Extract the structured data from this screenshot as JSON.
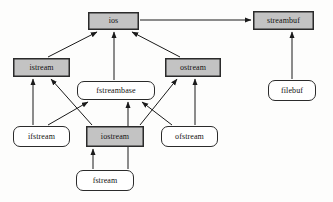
{
  "diagram": {
    "type": "class-inheritance-diagram",
    "canvas": {
      "width": 333,
      "height": 202
    },
    "colors": {
      "background": "#fdfdfc",
      "shaded_fill": "#c3c3c3",
      "plain_fill": "#ffffff",
      "stroke": "#2b2b2b",
      "text": "#111111"
    },
    "legend": {
      "shaded_meaning": "shaded box",
      "plain_meaning": "rounded white box"
    },
    "nodes": [
      {
        "id": "ios",
        "label": "ios",
        "style": "shaded",
        "x": 88,
        "y": 12,
        "w": 51,
        "h": 18
      },
      {
        "id": "streambuf",
        "label": "streambuf",
        "style": "shaded",
        "x": 253,
        "y": 11,
        "w": 61,
        "h": 19
      },
      {
        "id": "istream",
        "label": "istream",
        "style": "shaded",
        "x": 13,
        "y": 58,
        "w": 57,
        "h": 19
      },
      {
        "id": "ostream",
        "label": "ostream",
        "style": "shaded",
        "x": 165,
        "y": 58,
        "w": 56,
        "h": 19
      },
      {
        "id": "fstreambase",
        "label": "fstreambase",
        "style": "plain",
        "x": 77,
        "y": 81,
        "w": 78,
        "h": 19
      },
      {
        "id": "filebuf",
        "label": "filebuf",
        "style": "plain",
        "x": 268,
        "y": 80,
        "w": 48,
        "h": 21
      },
      {
        "id": "ifstream",
        "label": "ifstream",
        "style": "plain",
        "x": 13,
        "y": 126,
        "w": 57,
        "h": 21
      },
      {
        "id": "iostream",
        "label": "iostream",
        "style": "shaded",
        "x": 86,
        "y": 126,
        "w": 58,
        "h": 21
      },
      {
        "id": "ofstream",
        "label": "ofstream",
        "style": "plain",
        "x": 161,
        "y": 126,
        "w": 57,
        "h": 21
      },
      {
        "id": "fstream",
        "label": "fstream",
        "style": "plain",
        "x": 76,
        "y": 170,
        "w": 58,
        "h": 21
      }
    ],
    "edges": [
      {
        "from": "istream",
        "to": "ios",
        "arrow": "to-head"
      },
      {
        "from": "fstreambase",
        "to": "ios",
        "arrow": "to-head"
      },
      {
        "from": "ostream",
        "to": "ios",
        "arrow": "to-head"
      },
      {
        "from": "ios",
        "to": "streambuf",
        "arrow": "to-head"
      },
      {
        "from": "filebuf",
        "to": "streambuf",
        "arrow": "to-head"
      },
      {
        "from": "ifstream",
        "to": "istream",
        "arrow": "to-head"
      },
      {
        "from": "iostream",
        "to": "istream",
        "arrow": "to-head"
      },
      {
        "from": "ifstream",
        "to": "fstreambase",
        "arrow": "to-head"
      },
      {
        "from": "iostream",
        "to": "ostream",
        "arrow": "to-head"
      },
      {
        "from": "ofstream",
        "to": "ostream",
        "arrow": "to-head"
      },
      {
        "from": "ofstream",
        "to": "fstreambase",
        "arrow": "to-head"
      },
      {
        "from": "fstream",
        "to": "iostream",
        "arrow": "to-head"
      },
      {
        "from": "fstream",
        "to": "fstreambase",
        "arrow": "to-head"
      }
    ]
  }
}
